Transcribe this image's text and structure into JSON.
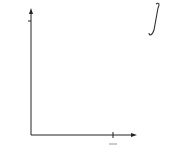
{
  "problem_number": "9.",
  "axis": {
    "x_label": "x",
    "y_label": "y",
    "y_tick_label": "1",
    "x_tick_label_num": "π",
    "x_tick_label_den": "4"
  },
  "curves": [
    {
      "name": "cos x",
      "from": [
        0,
        1
      ],
      "to_x_fraction_of_pi": 0.33
    },
    {
      "name": "sin x",
      "from": [
        0,
        0
      ],
      "to_x_fraction_of_pi": 0.33
    }
  ],
  "shaded_region": "between cos x (top) and sin x (bottom), from x=0 to x=π/4",
  "integral": {
    "lower_limit": "0",
    "upper_limit": "π/"
  },
  "colors": {
    "shade": "#c8c8c8",
    "ink": "#1a1a1a"
  }
}
